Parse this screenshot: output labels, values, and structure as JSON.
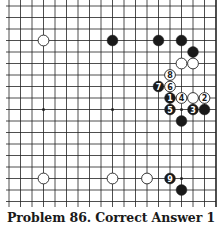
{
  "caption": "Problem 86. Correct Answer 1",
  "board": {
    "origin_x": 9,
    "origin_y": 6,
    "spacing": 11.5,
    "cols": 19,
    "rows": 18,
    "right_edge_col": 18,
    "line_color": "#222222",
    "stone_radius": 5.4,
    "colors": {
      "black": "#1a1a1a",
      "white": "#ffffff",
      "outline": "#222222"
    }
  },
  "star_points": [
    [
      3,
      9
    ],
    [
      9,
      9
    ],
    [
      15,
      9
    ],
    [
      15,
      15
    ]
  ],
  "stones": [
    {
      "color": "white",
      "col": 3,
      "row": 3,
      "label": ""
    },
    {
      "color": "black",
      "col": 9,
      "row": 3,
      "label": ""
    },
    {
      "color": "black",
      "col": 13,
      "row": 3,
      "label": ""
    },
    {
      "color": "black",
      "col": 15,
      "row": 3,
      "label": ""
    },
    {
      "color": "black",
      "col": 16,
      "row": 4,
      "label": ""
    },
    {
      "color": "white",
      "col": 15,
      "row": 5,
      "label": ""
    },
    {
      "color": "white",
      "col": 16,
      "row": 5,
      "label": ""
    },
    {
      "color": "white",
      "col": 14,
      "row": 6,
      "label": "8"
    },
    {
      "color": "black",
      "col": 13,
      "row": 7,
      "label": "7"
    },
    {
      "color": "white",
      "col": 14,
      "row": 7,
      "label": "6"
    },
    {
      "color": "black",
      "col": 14,
      "row": 8,
      "label": "1"
    },
    {
      "color": "white",
      "col": 15,
      "row": 8,
      "label": "4"
    },
    {
      "color": "white",
      "col": 16,
      "row": 8,
      "label": ""
    },
    {
      "color": "white",
      "col": 17,
      "row": 8,
      "label": "2"
    },
    {
      "color": "black",
      "col": 14,
      "row": 9,
      "label": "5"
    },
    {
      "color": "black",
      "col": 16,
      "row": 9,
      "label": "3"
    },
    {
      "color": "black",
      "col": 17,
      "row": 9,
      "label": ""
    },
    {
      "color": "black",
      "col": 15,
      "row": 10,
      "label": ""
    },
    {
      "color": "white",
      "col": 3,
      "row": 15,
      "label": ""
    },
    {
      "color": "white",
      "col": 9,
      "row": 15,
      "label": ""
    },
    {
      "color": "white",
      "col": 12,
      "row": 15,
      "label": ""
    },
    {
      "color": "black",
      "col": 14,
      "row": 15,
      "label": "9"
    },
    {
      "color": "black",
      "col": 15,
      "row": 16,
      "label": ""
    }
  ]
}
